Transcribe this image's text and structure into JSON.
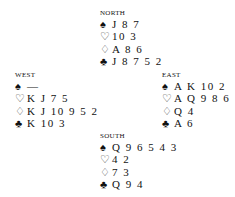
{
  "suits": {
    "spades": "♠",
    "hearts": "♡",
    "diamonds": "♢",
    "clubs": "♣"
  },
  "hands": {
    "north": {
      "label": "NORTH",
      "spades": "J 8 7",
      "hearts": "10 3",
      "diamonds": "A 8 6",
      "clubs": "J 8 7 5 2"
    },
    "west": {
      "label": "WEST",
      "spades": "—",
      "hearts": "K J 7 5",
      "diamonds": "K J 10 9 5 2",
      "clubs": "K 10 3"
    },
    "east": {
      "label": "EAST",
      "spades": "A K 10 2",
      "hearts": "A Q 9 8 6",
      "diamonds": "Q 4",
      "clubs": "A 6"
    },
    "south": {
      "label": "SOUTH",
      "spades": "Q 9 6 5 4 3",
      "hearts": "4 2",
      "diamonds": "7 3",
      "clubs": "Q 9 4"
    }
  }
}
